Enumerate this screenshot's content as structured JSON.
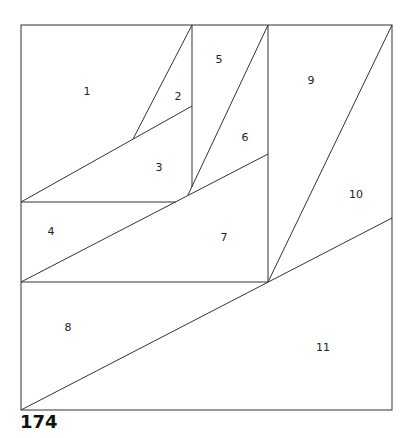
{
  "pattern": {
    "number": "174",
    "line_color": "#333333",
    "label_color": "#222222",
    "background": "#ffffff"
  },
  "outline": {
    "x": 21,
    "y": 25,
    "width": 371,
    "height": 385
  },
  "segments": [
    {
      "id": "seg-1-2",
      "x1": 192,
      "y1": 25,
      "x2": 133,
      "y2": 139
    },
    {
      "id": "seg-1-3",
      "x1": 21,
      "y1": 202,
      "x2": 192,
      "y2": 106
    },
    {
      "id": "seg-2-5-vertical",
      "x1": 192,
      "y1": 25,
      "x2": 192,
      "y2": 187
    },
    {
      "id": "seg-3-4",
      "x1": 21,
      "y1": 202,
      "x2": 176,
      "y2": 202
    },
    {
      "id": "seg-5-6",
      "x1": 268,
      "y1": 25,
      "x2": 188,
      "y2": 195
    },
    {
      "id": "seg-4-7",
      "x1": 21,
      "y1": 282,
      "x2": 268,
      "y2": 154
    },
    {
      "id": "seg-7-9-vertical",
      "x1": 268,
      "y1": 25,
      "x2": 268,
      "y2": 282
    },
    {
      "id": "seg-7-8",
      "x1": 21,
      "y1": 282,
      "x2": 268,
      "y2": 282
    },
    {
      "id": "seg-9-10",
      "x1": 392,
      "y1": 25,
      "x2": 268,
      "y2": 282
    },
    {
      "id": "seg-8-11",
      "x1": 21,
      "y1": 410,
      "x2": 392,
      "y2": 218
    }
  ],
  "pieces": [
    {
      "label": "1",
      "x": 87,
      "y": 92
    },
    {
      "label": "2",
      "x": 178,
      "y": 97
    },
    {
      "label": "3",
      "x": 159,
      "y": 168
    },
    {
      "label": "4",
      "x": 51,
      "y": 232
    },
    {
      "label": "5",
      "x": 219,
      "y": 60
    },
    {
      "label": "6",
      "x": 245,
      "y": 138
    },
    {
      "label": "7",
      "x": 224,
      "y": 238
    },
    {
      "label": "8",
      "x": 68,
      "y": 328
    },
    {
      "label": "9",
      "x": 311,
      "y": 81
    },
    {
      "label": "10",
      "x": 356,
      "y": 195
    },
    {
      "label": "11",
      "x": 323,
      "y": 348
    }
  ]
}
